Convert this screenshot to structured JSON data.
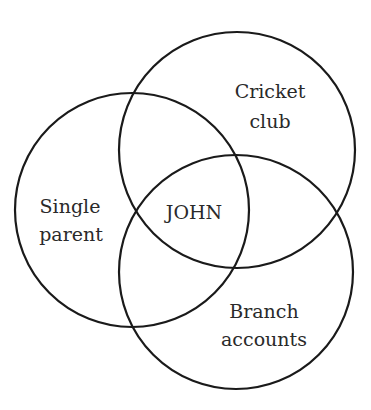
{
  "diagram": {
    "type": "venn",
    "sets": [
      {
        "id": "cricket",
        "label_lines": [
          "Cricket",
          "club"
        ],
        "cx": 237,
        "cy": 150,
        "r": 118
      },
      {
        "id": "single",
        "label_lines": [
          "Single",
          "parent"
        ],
        "cx": 132,
        "cy": 210,
        "r": 117
      },
      {
        "id": "branch",
        "label_lines": [
          "Branch",
          "accounts"
        ],
        "cx": 236,
        "cy": 272,
        "r": 117
      }
    ],
    "intersection_label": "JOHN",
    "stroke_color": "#1a1a1a",
    "background": "#ffffff"
  }
}
